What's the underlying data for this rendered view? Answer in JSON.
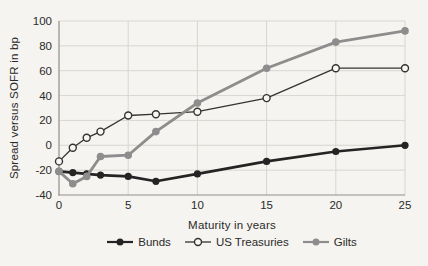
{
  "colors": {
    "background": "#f5f4f0",
    "text": "#2b2a28",
    "grid": "#d7d6d1",
    "axis": "#8f8e89",
    "open_marker_fill": "#f8f7f4"
  },
  "chart_data": {
    "type": "line",
    "title": "",
    "xlabel": "Maturity in years",
    "ylabel": "Spread versus SOFR in bp",
    "x": [
      0,
      1,
      2,
      3,
      5,
      7,
      10,
      15,
      20,
      25
    ],
    "series": [
      {
        "name": "Bunds",
        "values": [
          -21,
          -22,
          -23,
          -24,
          -25,
          -29,
          -23,
          -13,
          -5,
          0
        ],
        "color": "#242424",
        "marker": "filled",
        "line_width": 2.6,
        "marker_radius": 3.6
      },
      {
        "name": "US Treasuries",
        "values": [
          -13,
          -2,
          6,
          11,
          24,
          25,
          27,
          38,
          62,
          62
        ],
        "color": "#333333",
        "marker": "open",
        "line_width": 1.3,
        "marker_radius": 3.5
      },
      {
        "name": "Gilts",
        "values": [
          -21,
          -31,
          -25,
          -9,
          -8,
          11,
          34,
          62,
          83,
          92
        ],
        "color": "#8d8d8d",
        "marker": "filled",
        "line_width": 2.8,
        "marker_radius": 3.8
      }
    ],
    "xticks": [
      0,
      5,
      10,
      15,
      20,
      25
    ],
    "yticks": [
      -40,
      -20,
      0,
      20,
      40,
      60,
      80,
      100
    ],
    "xlim": [
      0,
      25
    ],
    "ylim": [
      -40,
      100
    ],
    "grid": true,
    "legend_position": "bottom"
  }
}
